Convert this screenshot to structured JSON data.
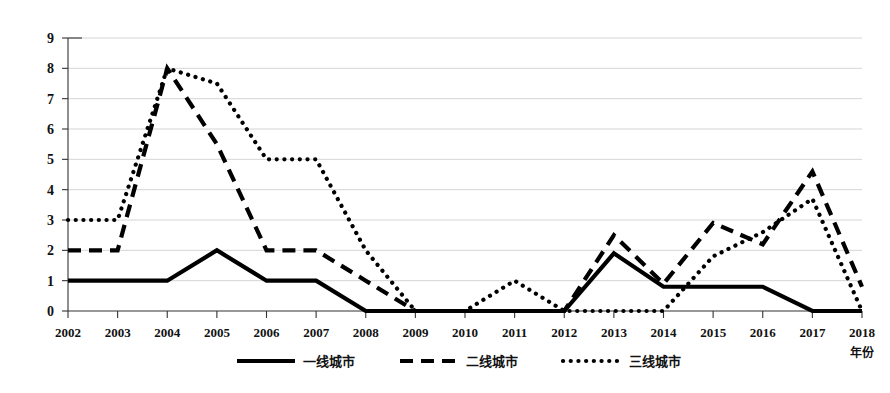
{
  "chart_data": {
    "type": "line",
    "title": "",
    "xlabel": "年份",
    "ylabel": "",
    "xlim": [
      2002,
      2018
    ],
    "ylim": [
      0,
      9
    ],
    "grid": true,
    "legend_position": "bottom",
    "categories": [
      "2002",
      "2003",
      "2004",
      "2005",
      "2006",
      "2007",
      "2008",
      "2009",
      "2010",
      "2011",
      "2012",
      "2013",
      "2014",
      "2015",
      "2016",
      "2017",
      "2018"
    ],
    "series": [
      {
        "name": "一线城市",
        "style": "solid",
        "values": [
          1,
          1,
          1,
          2,
          1,
          1,
          0,
          0,
          0,
          0,
          0,
          1.9,
          0.8,
          0.8,
          0.8,
          0,
          0
        ]
      },
      {
        "name": "二线城市",
        "style": "dashed",
        "values": [
          2,
          2,
          8,
          5.5,
          2,
          2,
          1,
          0,
          0,
          0,
          0,
          2.5,
          0.9,
          2.9,
          2.2,
          4.6,
          0.8
        ]
      },
      {
        "name": "三线城市",
        "style": "dotted",
        "values": [
          3,
          3,
          8,
          7.5,
          5,
          5,
          2,
          0,
          0,
          1,
          0,
          0,
          0,
          1.8,
          2.6,
          3.7,
          0
        ]
      }
    ],
    "y_ticks": [
      "0",
      "1",
      "2",
      "3",
      "4",
      "5",
      "6",
      "7",
      "8",
      "9"
    ],
    "x_ticks": [
      "2002",
      "2003",
      "2004",
      "2005",
      "2006",
      "2007",
      "2008",
      "2009",
      "2010",
      "2011",
      "2012",
      "2013",
      "2014",
      "2015",
      "2016",
      "2017",
      "2018"
    ]
  },
  "legend": {
    "items": [
      {
        "label": "一线城市",
        "style": "solid"
      },
      {
        "label": "二线城市",
        "style": "dashed"
      },
      {
        "label": "三线城市",
        "style": "dotted"
      }
    ]
  },
  "axis": {
    "x_title": "年份"
  },
  "colors": {
    "series": "#000000",
    "grid": "#c9c9c9",
    "axis": "#333333",
    "background": "#ffffff"
  }
}
